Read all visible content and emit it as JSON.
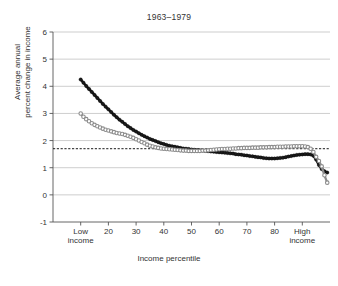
{
  "chart_data": {
    "type": "line",
    "title": "1963–1979",
    "xlabel": "Income percentile",
    "ylabel_line1": "Average annual",
    "ylabel_line2": "percent change in income",
    "ylabel": "Average annual percent change in income",
    "xlim": [
      0,
      100
    ],
    "ylim": [
      -1,
      6
    ],
    "yticks": [
      -1,
      0,
      1,
      2,
      3,
      4,
      5,
      6
    ],
    "ytick_labels": [
      "-1",
      "0",
      "1",
      "2",
      "3",
      "4",
      "5",
      "6"
    ],
    "xticks": [
      10,
      20,
      30,
      40,
      50,
      60,
      70,
      80,
      90
    ],
    "xtick_labels": [
      "Low income",
      "20",
      "30",
      "40",
      "50",
      "60",
      "70",
      "80",
      "High income"
    ],
    "xtick_labels_multiline": [
      [
        "Low",
        "income"
      ],
      [
        "20"
      ],
      [
        "30"
      ],
      [
        "40"
      ],
      [
        "50"
      ],
      [
        "60"
      ],
      [
        "70"
      ],
      [
        "80"
      ],
      [
        "High",
        "income"
      ]
    ],
    "grid": "horizontal",
    "grid_color": "#b8b8b8",
    "legend": "none",
    "reference_line": {
      "name": "overall average",
      "value": 1.7,
      "style": "dashed",
      "color": "#1a1a1a"
    },
    "series": [
      {
        "name": "black-filled-series",
        "marker": "filled-circle",
        "color": "#1a1a1a",
        "x": [
          10,
          11,
          12,
          13,
          14,
          15,
          16,
          17,
          18,
          19,
          20,
          21,
          22,
          23,
          24,
          25,
          26,
          27,
          28,
          29,
          30,
          31,
          32,
          33,
          34,
          35,
          36,
          37,
          38,
          39,
          40,
          41,
          42,
          43,
          44,
          45,
          46,
          47,
          48,
          49,
          50,
          51,
          52,
          53,
          54,
          55,
          56,
          57,
          58,
          59,
          60,
          61,
          62,
          63,
          64,
          65,
          66,
          67,
          68,
          69,
          70,
          71,
          72,
          73,
          74,
          75,
          76,
          77,
          78,
          79,
          80,
          81,
          82,
          83,
          84,
          85,
          86,
          87,
          88,
          89,
          90,
          91,
          92,
          93,
          94,
          95,
          96,
          97,
          98,
          99
        ],
        "y": [
          4.25,
          4.13,
          4.01,
          3.9,
          3.79,
          3.68,
          3.57,
          3.46,
          3.35,
          3.25,
          3.15,
          3.05,
          2.95,
          2.86,
          2.77,
          2.69,
          2.61,
          2.53,
          2.46,
          2.39,
          2.33,
          2.27,
          2.21,
          2.16,
          2.11,
          2.06,
          2.02,
          1.98,
          1.94,
          1.9,
          1.87,
          1.84,
          1.81,
          1.79,
          1.77,
          1.75,
          1.73,
          1.71,
          1.7,
          1.69,
          1.67,
          1.66,
          1.65,
          1.64,
          1.63,
          1.62,
          1.61,
          1.6,
          1.59,
          1.58,
          1.57,
          1.56,
          1.55,
          1.54,
          1.53,
          1.52,
          1.5,
          1.49,
          1.48,
          1.46,
          1.45,
          1.43,
          1.42,
          1.4,
          1.39,
          1.38,
          1.36,
          1.35,
          1.34,
          1.34,
          1.34,
          1.35,
          1.36,
          1.37,
          1.39,
          1.41,
          1.43,
          1.45,
          1.47,
          1.48,
          1.49,
          1.5,
          1.5,
          1.49,
          1.44,
          1.3,
          1.1,
          0.95,
          0.87,
          0.82
        ]
      },
      {
        "name": "gray-open-circle-series",
        "marker": "open-circle",
        "color": "#8c8c8c",
        "x": [
          10,
          11,
          12,
          13,
          14,
          15,
          16,
          17,
          18,
          19,
          20,
          21,
          22,
          23,
          24,
          25,
          26,
          27,
          28,
          29,
          30,
          31,
          32,
          33,
          34,
          35,
          36,
          37,
          38,
          39,
          40,
          41,
          42,
          43,
          44,
          45,
          46,
          47,
          48,
          49,
          50,
          51,
          52,
          53,
          54,
          55,
          56,
          57,
          58,
          59,
          60,
          61,
          62,
          63,
          64,
          65,
          66,
          67,
          68,
          69,
          70,
          71,
          72,
          73,
          74,
          75,
          76,
          77,
          78,
          79,
          80,
          81,
          82,
          83,
          84,
          85,
          86,
          87,
          88,
          89,
          90,
          91,
          92,
          93,
          94,
          95,
          96,
          97,
          98,
          99
        ],
        "y": [
          3.0,
          2.88,
          2.79,
          2.71,
          2.64,
          2.58,
          2.53,
          2.48,
          2.44,
          2.4,
          2.37,
          2.34,
          2.31,
          2.28,
          2.26,
          2.24,
          2.21,
          2.18,
          2.14,
          2.1,
          2.05,
          2.0,
          1.95,
          1.9,
          1.85,
          1.81,
          1.78,
          1.75,
          1.73,
          1.71,
          1.7,
          1.69,
          1.68,
          1.67,
          1.66,
          1.65,
          1.64,
          1.63,
          1.63,
          1.62,
          1.62,
          1.62,
          1.62,
          1.62,
          1.63,
          1.63,
          1.64,
          1.65,
          1.66,
          1.67,
          1.68,
          1.69,
          1.69,
          1.7,
          1.7,
          1.71,
          1.71,
          1.72,
          1.72,
          1.73,
          1.73,
          1.73,
          1.74,
          1.74,
          1.74,
          1.75,
          1.75,
          1.75,
          1.76,
          1.76,
          1.76,
          1.77,
          1.77,
          1.77,
          1.78,
          1.78,
          1.78,
          1.79,
          1.79,
          1.79,
          1.79,
          1.78,
          1.76,
          1.7,
          1.58,
          1.4,
          1.25,
          1.05,
          0.72,
          0.45
        ]
      }
    ]
  }
}
